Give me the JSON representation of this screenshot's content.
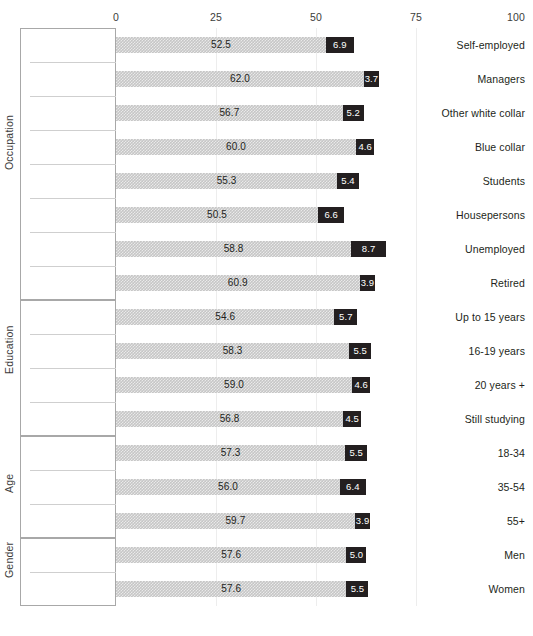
{
  "chart_data": {
    "type": "bar",
    "subtype": "stacked-horizontal",
    "title": "",
    "xlabel": "",
    "ylabel": "",
    "xlim": [
      0,
      100
    ],
    "xticks": [
      0,
      25,
      50,
      75,
      100
    ],
    "xtick_labels": [
      "0",
      "25",
      "50",
      "75",
      "100"
    ],
    "grid": true,
    "legend": "none",
    "orientation": "horizontal",
    "series": [
      {
        "name": "main",
        "color": "#c6c6c6"
      },
      {
        "name": "accent",
        "color": "#231f20"
      }
    ],
    "groups": [
      {
        "name": "Occupation",
        "categories": [
          "Self-employed",
          "Managers",
          "Other white collar",
          "Blue collar",
          "Students",
          "Housepersons",
          "Unemployed",
          "Retired"
        ],
        "main": [
          52.5,
          62.0,
          56.7,
          60.0,
          55.3,
          50.5,
          58.8,
          60.9
        ],
        "accent": [
          6.9,
          3.7,
          5.2,
          4.6,
          5.4,
          6.6,
          8.7,
          3.9
        ],
        "main_labels": [
          "52.5",
          "62.0",
          "56.7",
          "60.0",
          "55.3",
          "50.5",
          "58.8",
          "60.9"
        ],
        "accent_labels": [
          "6.9",
          "3.7",
          "5.2",
          "4.6",
          "5.4",
          "6.6",
          "8.7",
          "3.9"
        ]
      },
      {
        "name": "Education",
        "categories": [
          "Up to 15 years",
          "16-19 years",
          "20 years +",
          "Still studying"
        ],
        "main": [
          54.6,
          58.3,
          59.0,
          56.8
        ],
        "accent": [
          5.7,
          5.5,
          4.6,
          4.5
        ],
        "main_labels": [
          "54.6",
          "58.3",
          "59.0",
          "56.8"
        ],
        "accent_labels": [
          "5.7",
          "5.5",
          "4.6",
          "4.5"
        ]
      },
      {
        "name": "Age",
        "categories": [
          "18-34",
          "35-54",
          "55+"
        ],
        "main": [
          57.3,
          56.0,
          59.7
        ],
        "accent": [
          5.5,
          6.4,
          3.9
        ],
        "main_labels": [
          "57.3",
          "56.0",
          "59.7"
        ],
        "accent_labels": [
          "5.5",
          "6.4",
          "3.9"
        ]
      },
      {
        "name": "Gender",
        "categories": [
          "Men",
          "Women"
        ],
        "main": [
          57.6,
          57.6
        ],
        "accent": [
          5.0,
          5.5
        ],
        "main_labels": [
          "57.6",
          "57.6"
        ],
        "accent_labels": [
          "5.0",
          "5.5"
        ]
      }
    ]
  },
  "colors": {
    "main_bar": "#c6c6c6",
    "accent_bar": "#231f20",
    "frame": "#a8a8a8",
    "row_divider": "#cfcfcf",
    "gridline": "#ededed",
    "text": "#231f20"
  }
}
